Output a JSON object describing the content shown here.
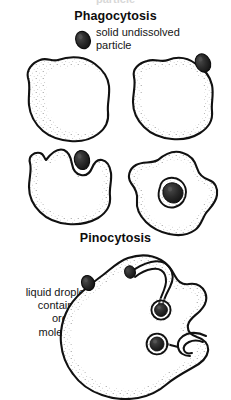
{
  "document": {
    "type": "biology-diagram",
    "title_cutoff_partial": "particle",
    "background_color": "#ffffff",
    "ink_color": "#111111"
  },
  "sections": [
    {
      "id": "phagocytosis",
      "heading": "Phagocytosis",
      "label": "solid undissolved\nparticle"
    },
    {
      "id": "pinocytosis",
      "heading": "Pinocytosis",
      "label": "liquid droplet\ncontaining\norganic\nmolecules"
    }
  ],
  "headings": {
    "phagocytosis": "Phagocytosis",
    "pinocytosis": "Pinocytosis"
  },
  "labels": {
    "particle_line_1": "solid undissolved",
    "particle_line_2": "particle",
    "droplet_line_1": "liquid droplet",
    "droplet_line_2": "containing",
    "droplet_line_3": "organic",
    "droplet_line_4": "molecules"
  },
  "figure_elements": {
    "phagocytosis_cells": [
      {
        "name": "amoeba-stage-1",
        "description": "round amoeboid cell, intact membrane, particle outside above-right"
      },
      {
        "name": "amoeba-stage-2",
        "description": "amoeboid cell with particle contacting membrane at top right"
      },
      {
        "name": "amoeba-stage-3",
        "description": "amoeboid cell with pseudopods surrounding particle at top"
      },
      {
        "name": "amoeba-stage-4",
        "description": "amoeboid cell with particle enclosed in food vacuole"
      }
    ],
    "phagocytosis_particles": [
      {
        "name": "solid-particle-free",
        "state": "outside cell"
      },
      {
        "name": "solid-particle-contact",
        "state": "touching membrane"
      },
      {
        "name": "solid-particle-engulfing",
        "state": "being engulfed by pseudopods"
      },
      {
        "name": "solid-particle-vacuole",
        "state": "inside food vacuole"
      }
    ],
    "pinocytosis_cell": {
      "name": "pinocytosis-amoeba",
      "description": "large amoeboid cell with two membrane invagination channels ending in internal vesicles",
      "channels": 2,
      "vesicles": 2
    },
    "pinocytosis_droplet": {
      "name": "liquid-droplet-free",
      "state": "outside cell"
    }
  },
  "colors": {
    "ink": "#111111",
    "particle_fill": "#262626",
    "cytoplasm": "#ffffff",
    "stipple": "#5a5a5a"
  }
}
